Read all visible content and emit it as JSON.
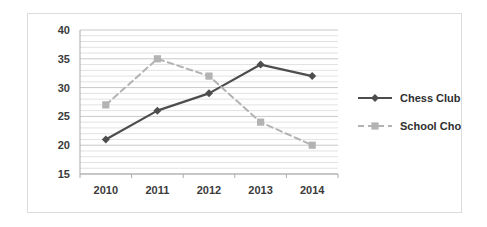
{
  "chart_data": {
    "type": "line",
    "title": "",
    "xlabel": "",
    "ylabel": "",
    "categories": [
      "2010",
      "2011",
      "2012",
      "2013",
      "2014"
    ],
    "series": [
      {
        "name": "Chess Club",
        "values": [
          21,
          26,
          29,
          34,
          32
        ],
        "color": "#4d4d4d",
        "marker": "diamond",
        "linestyle": "solid"
      },
      {
        "name": "School Choir",
        "values": [
          27,
          35,
          32,
          24,
          20
        ],
        "color": "#b3b3b3",
        "marker": "square",
        "linestyle": "dashed"
      }
    ],
    "ylim": [
      15,
      40
    ],
    "ytick_labels": [
      "15",
      "20",
      "25",
      "30",
      "35",
      "40"
    ],
    "ytick_values": [
      15,
      20,
      25,
      30,
      35,
      40
    ],
    "minor_gridline_step": 1,
    "grid": true,
    "legend_position": "right",
    "axis_color": "#aaaaaa",
    "gridline_color": "#c9c9c9",
    "minor_gridline_color": "#e2e2e2",
    "background_color": "#ffffff",
    "border_color": "#dcdcdc"
  }
}
